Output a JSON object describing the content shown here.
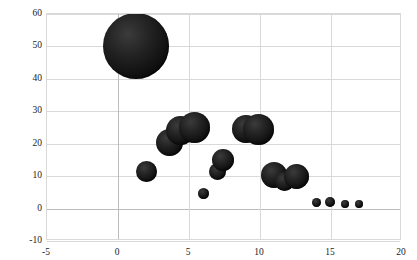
{
  "chart_data": {
    "type": "scatter",
    "title": "",
    "subtitle": "",
    "xlabel": "",
    "ylabel": "",
    "xlim": [
      -5,
      20
    ],
    "ylim": [
      -10,
      60
    ],
    "x_ticks": [
      -5,
      0,
      5,
      10,
      15,
      20
    ],
    "y_ticks": [
      -10,
      0,
      10,
      20,
      30,
      40,
      50,
      60
    ],
    "x_tick_labels": [
      "-5",
      "0",
      "5",
      "10",
      "15",
      "20"
    ],
    "y_tick_labels": [
      "-10",
      "0",
      "10",
      "20",
      "30",
      "40",
      "50",
      "60"
    ],
    "grid": true,
    "legend": "none",
    "marker_color": "#141414",
    "grid_color": "#d9d9d9",
    "axis_color": "#bcbcbc",
    "series": [
      {
        "name": "bubbles",
        "points": [
          {
            "x": 1.3,
            "y": 50.0,
            "size": 66
          },
          {
            "x": 2.0,
            "y": 11.5,
            "size": 21
          },
          {
            "x": 3.6,
            "y": 20.5,
            "size": 27
          },
          {
            "x": 4.4,
            "y": 24.0,
            "size": 29
          },
          {
            "x": 5.4,
            "y": 25.0,
            "size": 31
          },
          {
            "x": 6.0,
            "y": 4.5,
            "size": 11
          },
          {
            "x": 7.0,
            "y": 11.5,
            "size": 17
          },
          {
            "x": 7.4,
            "y": 15.0,
            "size": 22
          },
          {
            "x": 9.0,
            "y": 24.5,
            "size": 28
          },
          {
            "x": 9.9,
            "y": 24.5,
            "size": 31
          },
          {
            "x": 11.0,
            "y": 10.5,
            "size": 26
          },
          {
            "x": 11.7,
            "y": 8.5,
            "size": 19
          },
          {
            "x": 12.6,
            "y": 10.0,
            "size": 25
          },
          {
            "x": 14.0,
            "y": 2.0,
            "size": 9
          },
          {
            "x": 14.9,
            "y": 2.0,
            "size": 10
          },
          {
            "x": 16.0,
            "y": 1.3,
            "size": 8
          },
          {
            "x": 17.0,
            "y": 1.3,
            "size": 8
          }
        ]
      }
    ]
  }
}
